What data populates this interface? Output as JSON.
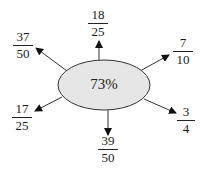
{
  "center": {
    "label": "73%",
    "fill": "#e6e6e6",
    "stroke": "#333333"
  },
  "fractions": [
    {
      "id": "top",
      "numerator": "18",
      "denominator": "25"
    },
    {
      "id": "top-left",
      "numerator": "37",
      "denominator": "50"
    },
    {
      "id": "top-right",
      "numerator": "7",
      "denominator": "10"
    },
    {
      "id": "bottom-left",
      "numerator": "17",
      "denominator": "25"
    },
    {
      "id": "bottom-right",
      "numerator": "3",
      "denominator": "4"
    },
    {
      "id": "bottom",
      "numerator": "39",
      "denominator": "50"
    }
  ]
}
